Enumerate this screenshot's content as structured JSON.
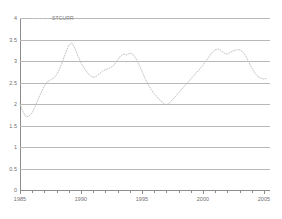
{
  "chart_data": {
    "type": "line",
    "title": "",
    "subtitle": "",
    "xlabel": "",
    "ylabel": "",
    "xlim": [
      1985,
      2005.5
    ],
    "ylim": [
      0,
      4
    ],
    "grid": true,
    "legend_position": "top-left",
    "line_style": "dotted",
    "line_color": "#c2c2c2",
    "ytick_labels": [
      "4",
      "3.5",
      "3",
      "2.5",
      "2",
      "1.5",
      "1",
      "0.5",
      "0"
    ],
    "ytick_values": [
      4,
      3.5,
      3,
      2.5,
      2,
      1.5,
      1,
      0.5,
      0
    ],
    "xtick_labels": [
      "1985",
      "1990",
      "1995",
      "2000",
      "2005"
    ],
    "xtick_values": [
      1985,
      1990,
      1995,
      2000,
      2005
    ],
    "xtick_minor_values": [
      1986,
      1987,
      1988,
      1989,
      1991,
      1992,
      1993,
      1994,
      1996,
      1997,
      1998,
      1999,
      2001,
      2002,
      2003,
      2004
    ],
    "series": [
      {
        "name": "STCURR",
        "x": [
          1985.0,
          1985.25,
          1985.5,
          1985.75,
          1986.0,
          1986.25,
          1986.5,
          1986.75,
          1987.0,
          1987.25,
          1987.5,
          1987.75,
          1988.0,
          1988.25,
          1988.5,
          1988.75,
          1989.0,
          1989.25,
          1989.5,
          1989.75,
          1990.0,
          1990.25,
          1990.5,
          1990.75,
          1991.0,
          1991.25,
          1991.5,
          1991.75,
          1992.0,
          1992.25,
          1992.5,
          1992.75,
          1993.0,
          1993.25,
          1993.5,
          1993.75,
          1994.0,
          1994.25,
          1994.5,
          1994.75,
          1995.0,
          1995.25,
          1995.5,
          1995.75,
          1996.0,
          1996.25,
          1996.5,
          1996.75,
          1997.0,
          1997.25,
          1997.5,
          1997.75,
          1998.0,
          1998.25,
          1998.5,
          1998.75,
          1999.0,
          1999.25,
          1999.5,
          1999.75,
          2000.0,
          2000.25,
          2000.5,
          2000.75,
          2001.0,
          2001.25,
          2001.5,
          2001.75,
          2002.0,
          2002.25,
          2002.5,
          2002.75,
          2003.0,
          2003.25,
          2003.5,
          2003.75,
          2004.0,
          2004.25,
          2004.5,
          2004.75,
          2005.0,
          2005.25
        ],
        "y": [
          2.0,
          1.82,
          1.7,
          1.72,
          1.8,
          1.95,
          2.12,
          2.28,
          2.42,
          2.52,
          2.56,
          2.6,
          2.68,
          2.82,
          3.0,
          3.2,
          3.36,
          3.42,
          3.3,
          3.12,
          2.96,
          2.84,
          2.74,
          2.66,
          2.62,
          2.64,
          2.7,
          2.76,
          2.8,
          2.82,
          2.86,
          2.92,
          3.02,
          3.12,
          3.16,
          3.14,
          3.18,
          3.16,
          3.06,
          2.92,
          2.76,
          2.6,
          2.46,
          2.34,
          2.24,
          2.16,
          2.08,
          2.02,
          1.98,
          2.02,
          2.1,
          2.18,
          2.26,
          2.34,
          2.42,
          2.5,
          2.58,
          2.66,
          2.74,
          2.82,
          2.9,
          3.0,
          3.1,
          3.2,
          3.26,
          3.28,
          3.24,
          3.18,
          3.16,
          3.2,
          3.24,
          3.26,
          3.26,
          3.22,
          3.12,
          2.98,
          2.84,
          2.72,
          2.64,
          2.6,
          2.58,
          2.6
        ]
      }
    ]
  }
}
